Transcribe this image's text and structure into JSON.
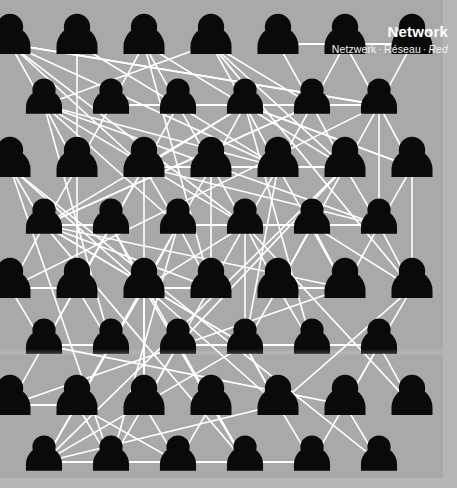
{
  "poster": {
    "title": "Network",
    "subtitle_parts": [
      "Netzwerk",
      "Réseau",
      "Red"
    ],
    "subtitle_separator": "·",
    "subtitle_italic_part": "Red",
    "subtitle_full": "Netzwerk · Réseau · Red"
  },
  "colors": {
    "background": "#a9a9a9",
    "margin": "#b5b5b5",
    "node": "#0a0a0a",
    "edge": "#ffffff",
    "title_text": "#ffffff",
    "subtitle_text": "#f2f2f2"
  },
  "graphic": {
    "type": "node-network",
    "icon_name": "person-icon",
    "row_count": 8,
    "major_row_node_count": 7,
    "offset_row_node_count": 6,
    "total_nodes": 52,
    "rows": [
      {
        "index": 0,
        "y": 44,
        "start_x": 10,
        "spacing": 67,
        "count": 7,
        "scale": 1.0
      },
      {
        "index": 1,
        "y": 105,
        "start_x": 44,
        "spacing": 67,
        "count": 6,
        "scale": 0.88
      },
      {
        "index": 2,
        "y": 167,
        "start_x": 10,
        "spacing": 67,
        "count": 7,
        "scale": 1.0
      },
      {
        "index": 3,
        "y": 225,
        "start_x": 44,
        "spacing": 67,
        "count": 6,
        "scale": 0.88
      },
      {
        "index": 4,
        "y": 288,
        "start_x": 10,
        "spacing": 67,
        "count": 7,
        "scale": 1.0
      },
      {
        "index": 5,
        "y": 345,
        "start_x": 44,
        "spacing": 67,
        "count": 6,
        "scale": 0.88
      },
      {
        "index": 6,
        "y": 405,
        "start_x": 10,
        "spacing": 67,
        "count": 7,
        "scale": 1.0
      },
      {
        "index": 7,
        "y": 462,
        "start_x": 44,
        "spacing": 67,
        "count": 6,
        "scale": 0.88
      }
    ]
  }
}
